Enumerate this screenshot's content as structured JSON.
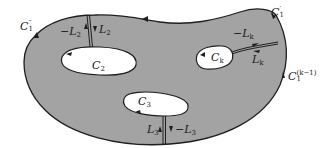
{
  "diagram": {
    "type": "multiply-connected-region",
    "colors": {
      "region_fill": "#a3a3a3",
      "boundary": "#1e1e1e",
      "hole_fill": "#ffffff",
      "background": "#ffffff"
    },
    "outer_boundary_labels": {
      "c1_double_prime": {
        "base": "C",
        "sub": "1",
        "sup": "′′"
      },
      "c1_prime": {
        "base": "C",
        "sub": "1",
        "sup": "′"
      },
      "c1_k_minus_1": {
        "base": "C",
        "sub": "1",
        "sup": "(k−1)"
      }
    },
    "holes": [
      {
        "id": "c2",
        "base": "C",
        "sub": "2"
      },
      {
        "id": "ck",
        "base": "C",
        "sub": "k"
      },
      {
        "id": "c3",
        "base": "C",
        "sub": "3"
      }
    ],
    "cuts": {
      "l2": {
        "neg": "−L",
        "pos": "L",
        "sub": "2"
      },
      "lk": {
        "neg": "−L",
        "pos": "L",
        "sub": "k"
      },
      "l3": {
        "neg": "−L",
        "pos": "L",
        "sub": "3"
      }
    }
  }
}
